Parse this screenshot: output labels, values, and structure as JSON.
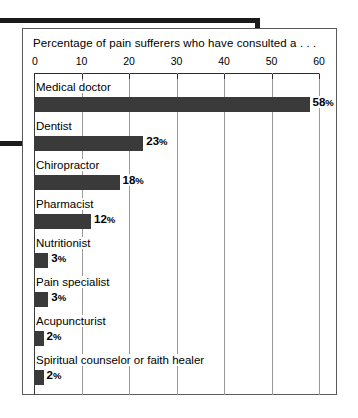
{
  "chart_data": {
    "type": "bar",
    "orientation": "horizontal",
    "title": "Percentage of pain sufferers who have consulted a . . .",
    "xlabel": "",
    "ylabel": "",
    "xlim": [
      0,
      60
    ],
    "xticks": [
      0,
      10,
      20,
      30,
      40,
      50,
      60
    ],
    "xtick_labels": [
      "0",
      "10",
      "20",
      "30",
      "40",
      "50",
      "60"
    ],
    "grid": true,
    "grid_axis": "x",
    "legend": false,
    "bar_color": "#3a3a3a",
    "categories": [
      "Medical doctor",
      "Dentist",
      "Chiropractor",
      "Pharmacist",
      "Nutritionist",
      "Pain specialist",
      "Acupuncturist",
      "Spiritual counselor or faith healer"
    ],
    "values": [
      58,
      23,
      18,
      12,
      3,
      3,
      2,
      2
    ],
    "value_labels": [
      "58%",
      "23%",
      "18%",
      "12%",
      "3%",
      "3%",
      "2%",
      "2%"
    ],
    "bars": [
      {
        "label": "Medical doctor",
        "value": 58,
        "value_label": "58",
        "unit": "%"
      },
      {
        "label": "Dentist",
        "value": 23,
        "value_label": "23",
        "unit": "%"
      },
      {
        "label": "Chiropractor",
        "value": 18,
        "value_label": "18",
        "unit": "%"
      },
      {
        "label": "Pharmacist",
        "value": 12,
        "value_label": "12",
        "unit": "%"
      },
      {
        "label": "Nutritionist",
        "value": 3,
        "value_label": "3",
        "unit": "%"
      },
      {
        "label": "Pain specialist",
        "value": 3,
        "value_label": "3",
        "unit": "%"
      },
      {
        "label": "Acupuncturist",
        "value": 2,
        "value_label": "2",
        "unit": "%"
      },
      {
        "label": "Spiritual counselor or faith healer",
        "value": 2,
        "value_label": "2",
        "unit": "%"
      }
    ]
  }
}
